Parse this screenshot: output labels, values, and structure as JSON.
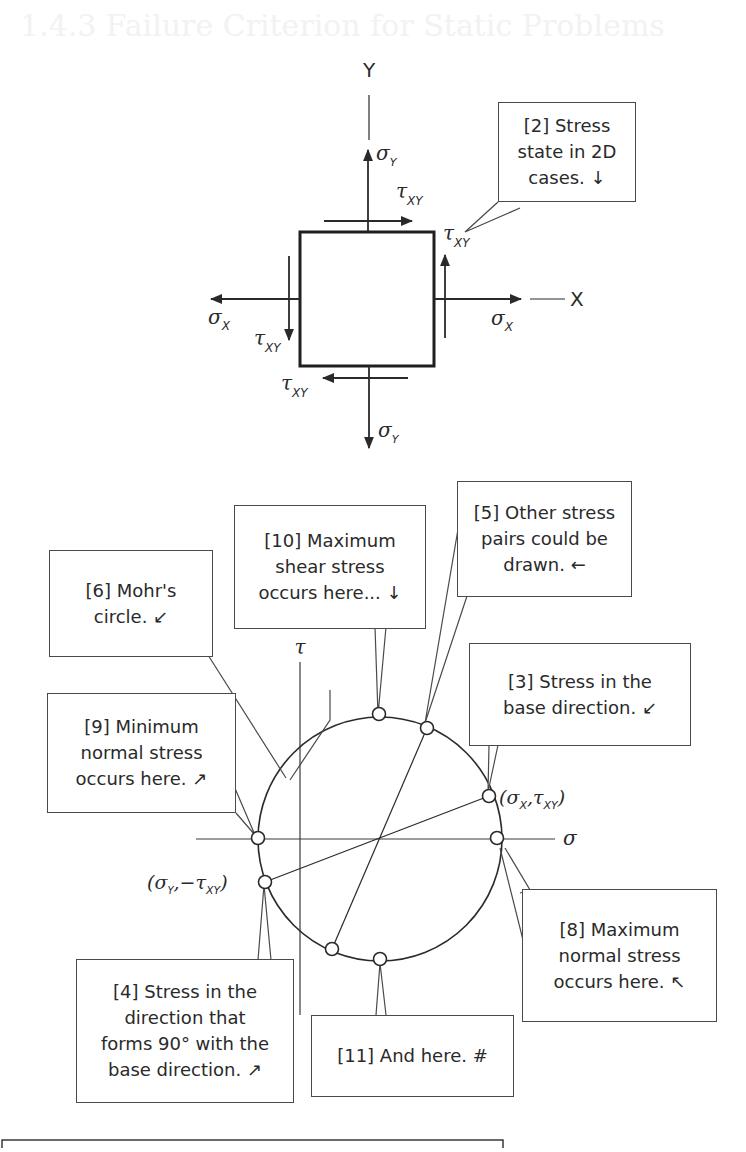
{
  "page": {
    "section_heading": "1.4.3 Failure Criterion for Static Problems"
  },
  "element_diagram": {
    "axis_y_label": "Y",
    "axis_x_label": "X",
    "sigma_symbol": "σ",
    "tau_symbol": "τ",
    "sub_x": "X",
    "sub_y": "Y",
    "sub_xy": "XY",
    "callout_2": "[2] Stress\nstate in 2D\ncases. ↓"
  },
  "mohr_diagram": {
    "axis_sigma_label": "σ",
    "axis_tau_label": "τ",
    "point_a_label": {
      "open": "(",
      "sigma": "σ",
      "sub1": "X",
      "comma": ",",
      "tau": "τ",
      "sub2": "XY",
      "close": ")"
    },
    "point_b_label": {
      "open": "(",
      "sigma": "σ",
      "sub1": "Y",
      "comma": ",−",
      "tau": "τ",
      "sub2": "XY",
      "close": ")"
    },
    "callouts": {
      "c3": "[3] Stress in the\nbase direction. ↙",
      "c4": "[4] Stress in the\ndirection that\nforms 90° with the\nbase direction. ↗",
      "c5": "[5] Other stress\npairs could be\ndrawn. ←",
      "c6": "[6] Mohr's\ncircle. ↙",
      "c8": "[8] Maximum\nnormal stress\noccurs here. ↖",
      "c9": "[9] Minimum\nnormal stress\noccurs here. ↗",
      "c10": "[10] Maximum\nshear stress\noccurs here... ↓",
      "c11": "[11] And here. #"
    }
  },
  "colors": {
    "ink": "#2a2a2a",
    "frame": "#4a4a4a",
    "background": "#ffffff"
  }
}
